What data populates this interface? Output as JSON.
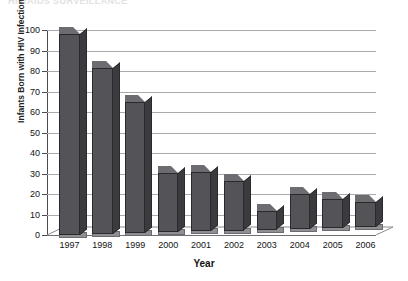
{
  "figure": {
    "clipped_title": "HIV/AIDS SURVEILLANCE",
    "x_axis_title": "Year",
    "y_axis_title": "Infants Born with HIV Infection"
  },
  "chart_data": {
    "type": "bar",
    "title": "",
    "xlabel": "Year",
    "ylabel": "Infants Born with HIV Infection",
    "categories": [
      "1997",
      "1998",
      "1999",
      "2000",
      "2001",
      "2002",
      "2003",
      "2004",
      "2005",
      "2006"
    ],
    "values": [
      98,
      81,
      64,
      29,
      29,
      24,
      9,
      17,
      14,
      12
    ],
    "ylim": [
      0,
      100
    ],
    "yticks": [
      0,
      10,
      20,
      30,
      40,
      50,
      60,
      70,
      80,
      90,
      100
    ],
    "grid": true,
    "legend": "none",
    "style": "3d-column",
    "colors": {
      "bar_front": "#545458",
      "bar_top": "#6c6c71",
      "bar_side": "#3b3b3f",
      "floor": "#8e8e93",
      "gridline": "#a9a9b0",
      "axis": "#4a4a50",
      "background": "#ffffff"
    }
  }
}
